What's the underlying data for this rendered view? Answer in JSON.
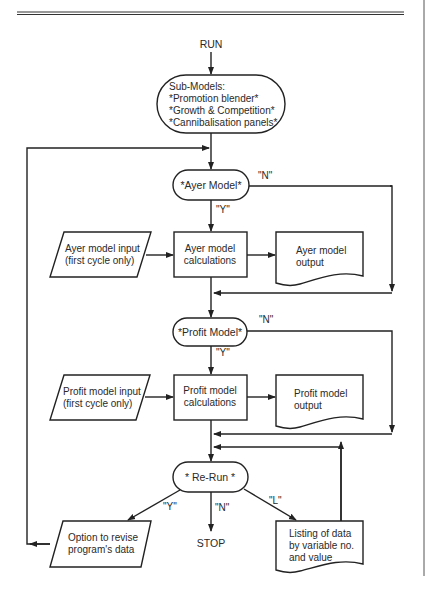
{
  "page": {
    "header_text": "",
    "chapter_rule": true
  },
  "flowchart": {
    "start": {
      "label": "RUN"
    },
    "submodels": {
      "title": "Sub-Models:",
      "lines": [
        "*Promotion blender*",
        "*Growth & Competition*",
        "*Cannibalisation panels*"
      ]
    },
    "ayer": {
      "decision": "*Ayer Model*",
      "yes_label": "\"Y\"",
      "no_label": "\"N\"",
      "input_line1": "Ayer model input",
      "input_line2": "(first cycle only)",
      "calc_line1": "Ayer model",
      "calc_line2": "calculations",
      "output_line1": "Ayer model",
      "output_line2": "output"
    },
    "profit": {
      "decision": "*Profit Model*",
      "yes_label": "\"Y\"",
      "no_label": "\"N\"",
      "input_line1": "Profit model input",
      "input_line2": "(first cycle only)",
      "calc_line1": "Profit model",
      "calc_line2": "calculations",
      "output_line1": "Profit model",
      "output_line2": "output"
    },
    "rerun": {
      "decision": "* Re-Run *",
      "y_label": "\"Y\"",
      "n_label": "\"N\"",
      "l_label": "\"L\"",
      "option_line1": "Option to revise",
      "option_line2": "program's data",
      "stop": "STOP",
      "listing_line1": "Listing of data",
      "listing_line2": "by variable no.",
      "listing_line3": "and value"
    }
  }
}
